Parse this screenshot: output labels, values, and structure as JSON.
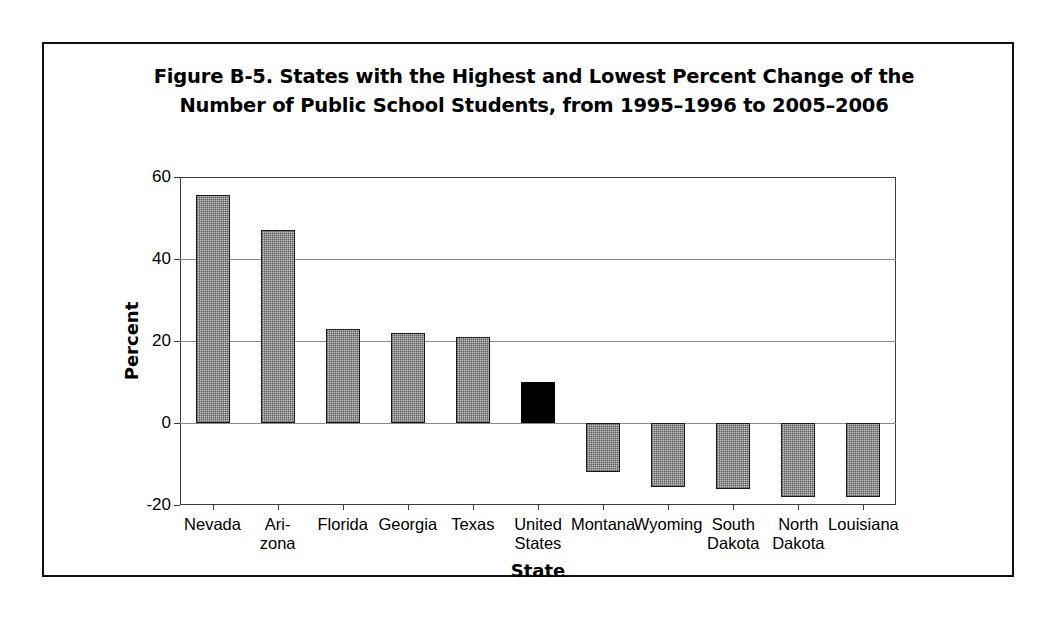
{
  "figure": {
    "title_line1": "Figure B-5. States with the Highest and Lowest Percent Change of the",
    "title_line2": "Number of Public School Students, from 1995–1996 to 2005–2006"
  },
  "chart_data": {
    "type": "bar",
    "title": "Figure B-5. States with the Highest and Lowest Percent Change of the Number of Public School Students, from 1995–1996 to 2005–2006",
    "xlabel": "State",
    "ylabel": "Percent",
    "ylim": [
      -20,
      60
    ],
    "yticks": [
      60,
      40,
      20,
      0,
      -20
    ],
    "ytick_labels": [
      "60",
      "40",
      "20",
      "0",
      "-20"
    ],
    "grid": true,
    "legend": "none",
    "highlight_category": "United States",
    "highlight_color": "#000000",
    "bar_color": "#c8c8c8",
    "categories": [
      "Nevada",
      "Arizona",
      "Florida",
      "Georgia",
      "Texas",
      "United States",
      "Montana",
      "Wyoming",
      "South Dakota",
      "North Dakota",
      "Louisiana"
    ],
    "category_label_lines": [
      [
        "Nevada"
      ],
      [
        "Ari-",
        "zona"
      ],
      [
        "Florida"
      ],
      [
        "Georgia"
      ],
      [
        "Texas"
      ],
      [
        "United",
        "States"
      ],
      [
        "Montana"
      ],
      [
        "Wyoming"
      ],
      [
        "South",
        "Dakota"
      ],
      [
        "North",
        "Dakota"
      ],
      [
        "Louisiana"
      ]
    ],
    "values": [
      55.5,
      47,
      23,
      22,
      21,
      10,
      -12,
      -15.5,
      -16,
      -18,
      -18
    ]
  }
}
